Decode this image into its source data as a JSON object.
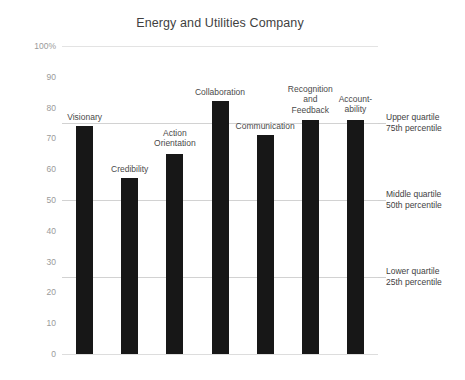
{
  "chart_data": {
    "type": "bar",
    "title": "Energy and Utilities Company",
    "xlabel": "",
    "ylabel": "",
    "ylim": [
      0,
      100
    ],
    "grid": true,
    "legend": "none",
    "categories": [
      "Visionary",
      "Credibility",
      "Action Orientation",
      "Collaboration",
      "Communication",
      "Recognition and Feedback",
      "Accountability"
    ],
    "category_labels_display": [
      "Visionary",
      "Credibility",
      "Action\nOrientation",
      "Collaboration",
      "Communication",
      "Recognition\nand\nFeedback",
      "Account-\nability"
    ],
    "values": [
      74,
      57,
      65,
      82,
      71,
      76,
      76
    ],
    "bar_color": "#171717",
    "y_ticks": [
      0,
      10,
      20,
      30,
      40,
      50,
      60,
      70,
      80,
      90,
      100
    ],
    "y_tick_labels": [
      "0",
      "10",
      "20",
      "30",
      "40",
      "50",
      "60",
      "70",
      "80",
      "90",
      "100%"
    ],
    "reference_lines": [
      {
        "value": 75,
        "label": "Upper quartile\n75th percentile"
      },
      {
        "value": 50,
        "label": "Middle quartile\n50th percentile"
      },
      {
        "value": 25,
        "label": "Lower quartile\n25th percentile"
      }
    ],
    "gridline_color": "#d2d2d2",
    "text_color": "#3f3f3f",
    "axis_label_color": "#9a9a9a",
    "background": "#ffffff"
  }
}
